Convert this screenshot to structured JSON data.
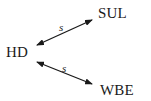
{
  "diagram": {
    "nodes": [
      {
        "id": "HD",
        "label": "HD"
      },
      {
        "id": "SUL",
        "label": "SUL"
      },
      {
        "id": "WBE",
        "label": "WBE"
      }
    ],
    "edges": [
      {
        "from": "HD",
        "to": "SUL",
        "label": "s",
        "direction": "bidirectional"
      },
      {
        "from": "HD",
        "to": "WBE",
        "label": "s",
        "direction": "bidirectional"
      }
    ]
  }
}
